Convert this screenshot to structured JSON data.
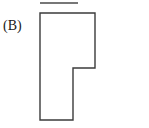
{
  "page": {
    "width": 149,
    "height": 128,
    "background_color": "#ffffff"
  },
  "figure": {
    "label": "(B)",
    "stroke_color": "#3b3b3b",
    "fill_color": "#ffffff",
    "stroke_width": 1.4,
    "outline_points": "40,13 95,13 95,68 73,68 73,120 40,120",
    "vertices": [
      {
        "name": "top-left",
        "x": 40,
        "y": 13
      },
      {
        "name": "top-right",
        "x": 95,
        "y": 13
      },
      {
        "name": "right-step-top",
        "x": 95,
        "y": 68
      },
      {
        "name": "inner-corner",
        "x": 73,
        "y": 68
      },
      {
        "name": "lower-right",
        "x": 73,
        "y": 120
      },
      {
        "name": "bottom-left",
        "x": 40,
        "y": 120
      }
    ]
  },
  "cropped_fragment": {
    "description": "partial horizontal rule cut off at the top edge of the crop",
    "stroke_color": "#4a4a4a",
    "stroke_width": 1.4,
    "x1": 40,
    "y1": 3,
    "x2": 78,
    "y2": 3
  }
}
